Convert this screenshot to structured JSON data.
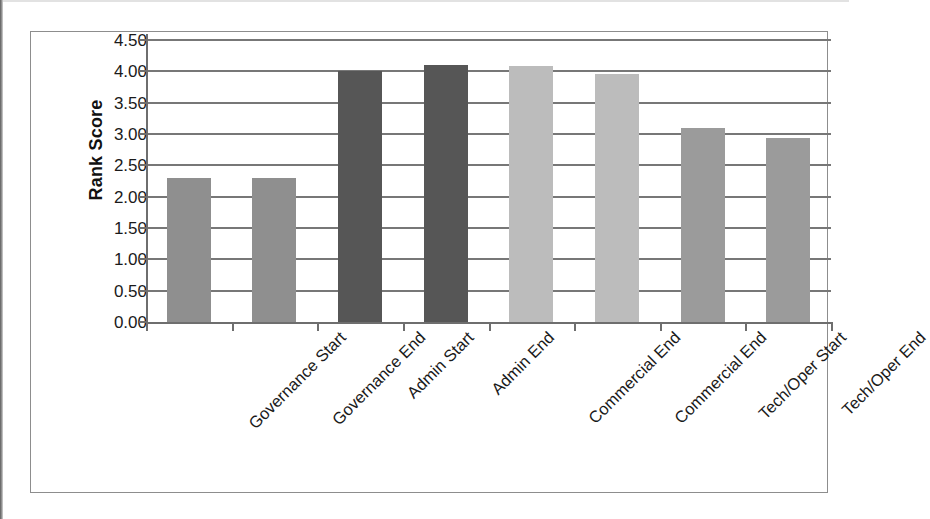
{
  "chart_data": {
    "type": "bar",
    "title": "",
    "xlabel": "",
    "ylabel": "Rank Score",
    "ylim": [
      0,
      4.5
    ],
    "y_tick_step": 0.5,
    "grid": true,
    "legend": "none",
    "categories": [
      "Governance Start",
      "Governance End",
      "Admin Start",
      "Admin End",
      "Commercial End",
      "Commercial End",
      "Tech/Oper Start",
      "Tech/Oper End"
    ],
    "values": [
      2.3,
      2.3,
      4.0,
      4.1,
      4.08,
      3.95,
      3.1,
      2.93
    ],
    "bar_colors": [
      "#8f8f8f",
      "#8f8f8f",
      "#565656",
      "#565656",
      "#bcbcbc",
      "#bcbcbc",
      "#9b9b9b",
      "#9b9b9b"
    ],
    "y_tick_labels": [
      "4.50",
      "4.00",
      "3.50",
      "3.00",
      "2.50",
      "2.00",
      "1.50",
      "1.00",
      "0.50",
      "0.00"
    ],
    "y_tick_values": [
      4.5,
      4.0,
      3.5,
      3.0,
      2.5,
      2.0,
      1.5,
      1.0,
      0.5,
      0.0
    ]
  },
  "axis": {
    "y_title": "Rank Score"
  },
  "colors": {
    "gridline": "#777777",
    "axis_line": "#6e6e6e",
    "frame": "#8d8d8d",
    "text": "#1a1a1a",
    "background": "#ffffff"
  }
}
